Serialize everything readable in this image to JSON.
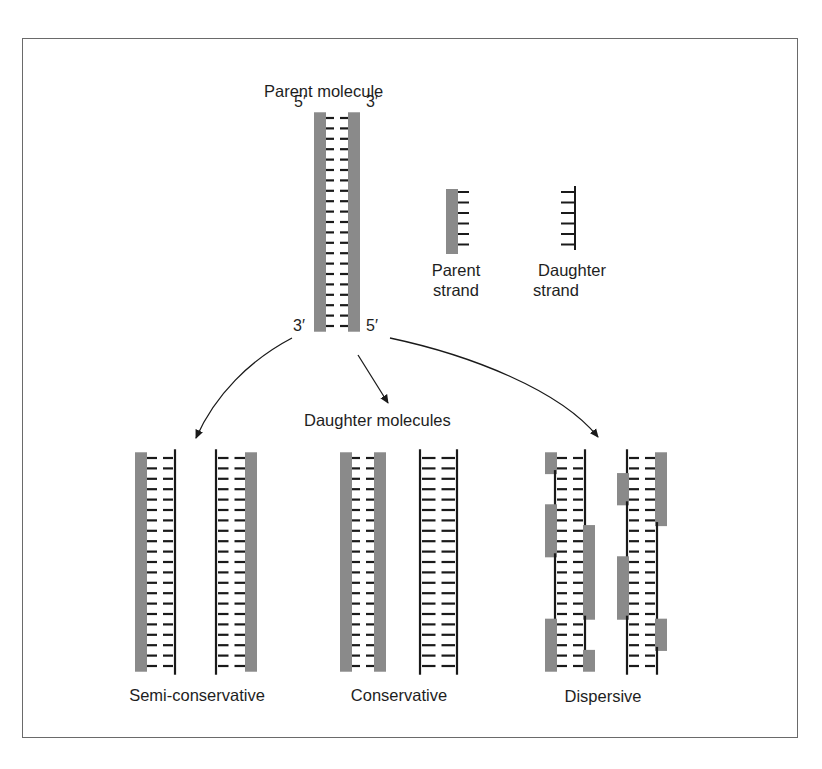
{
  "title": "Parent molecule",
  "parent_molecule": {
    "label": "Parent molecule",
    "end_labels": {
      "top_left": "5′",
      "top_right": "3′",
      "bottom_left": "3′",
      "bottom_right": "5′"
    },
    "rungs": 21
  },
  "legend": {
    "parent_strand": {
      "label_line1": "Parent",
      "label_line2": "strand"
    },
    "daughter_strand": {
      "label_line1": "Daughter",
      "label_line2": "strand"
    }
  },
  "daughter_molecules_label": "Daughter molecules",
  "models": [
    {
      "name": "Semi-conservative",
      "molecules": 2,
      "description": "each daughter has one parent strand and one new strand"
    },
    {
      "name": "Conservative",
      "molecules": 2,
      "description": "one molecule fully parental, one fully new"
    },
    {
      "name": "Dispersive",
      "molecules": 2,
      "description": "both strands mix parental and new segments"
    }
  ],
  "colors": {
    "parent_strand": "#8a8a8a",
    "daughter_strand": "#1a1a1a",
    "frame_border": "#6a6a6a",
    "background": "#ffffff"
  }
}
